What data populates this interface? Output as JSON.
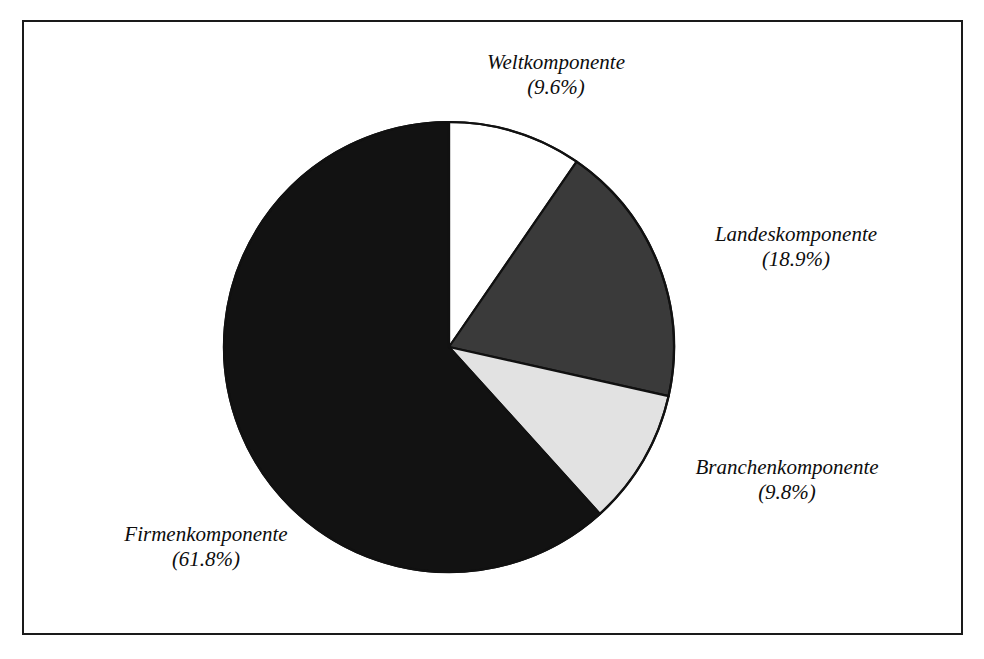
{
  "figure": {
    "background_color": "#ffffff",
    "frame_color": "#1a1a1a",
    "scan_artifact_text": " "
  },
  "chart_data": {
    "type": "pie",
    "title": "",
    "subtitle": "",
    "xlabel": "",
    "ylabel": "",
    "legend_position": "none",
    "grid": false,
    "labels_format": "name on first line, percentage in parentheses on second line",
    "start_angle_deg": 0,
    "direction": "clockwise",
    "categories": [
      "Weltkomponente",
      "Landeskomponente",
      "Branchenkomponente",
      "Firmenkomponente"
    ],
    "values": [
      9.6,
      18.9,
      9.8,
      61.8
    ],
    "value_labels": [
      "(9.6%)",
      "(18.9%)",
      "(9.8%)",
      "(61.8%)"
    ],
    "colors": [
      "#ffffff",
      "#3a3a3a",
      "#e2e2e2",
      "#121212"
    ],
    "slices": [
      {
        "name": "Weltkomponente",
        "value": 9.6,
        "value_label": "(9.6%)",
        "color": "#ffffff",
        "start_angle_deg": 0.0,
        "end_angle_deg": 34.56
      },
      {
        "name": "Landeskomponente",
        "value": 18.9,
        "value_label": "(18.9%)",
        "color": "#3a3a3a",
        "start_angle_deg": 34.56,
        "end_angle_deg": 102.6
      },
      {
        "name": "Branchenkomponente",
        "value": 9.8,
        "value_label": "(9.8%)",
        "color": "#e2e2e2",
        "start_angle_deg": 102.6,
        "end_angle_deg": 137.88
      },
      {
        "name": "Firmenkomponente",
        "value": 61.8,
        "value_label": "(61.8%)",
        "color": "#121212",
        "start_angle_deg": 137.88,
        "end_angle_deg": 360.0
      }
    ]
  },
  "labels": {
    "welt": {
      "name": "Weltkomponente",
      "value": "(9.6%)"
    },
    "landes": {
      "name": "Landeskomponente",
      "value": "(18.9%)"
    },
    "branchen": {
      "name": "Branchenkomponente",
      "value": "(9.8%)"
    },
    "firmen": {
      "name": "Firmenkomponente",
      "value": "(61.8%)"
    }
  }
}
